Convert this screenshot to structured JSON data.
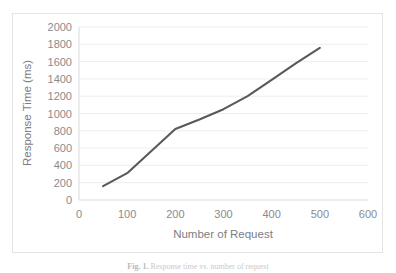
{
  "figure": {
    "caption_label": "Fig. 1.",
    "caption_text": "Response time vs. number of request"
  },
  "chart_data": {
    "type": "line",
    "title": "",
    "xlabel": "Number of Request",
    "ylabel": "Response Time (ms)",
    "xlim": [
      0,
      600
    ],
    "ylim": [
      0,
      2000
    ],
    "xticks": [
      0,
      100,
      200,
      300,
      400,
      500,
      600
    ],
    "xtick_labels": [
      "0",
      "100",
      "200",
      "300",
      "400",
      "500",
      "600"
    ],
    "yticks": [
      0,
      200,
      400,
      600,
      800,
      1000,
      1200,
      1400,
      1600,
      1800,
      2000
    ],
    "ytick_labels": [
      "0",
      "200",
      "400",
      "600",
      "800",
      "1000",
      "1200",
      "1400",
      "1600",
      "1800",
      "2000"
    ],
    "grid": "horizontal",
    "legend": "none",
    "series": [
      {
        "name": "Response Time",
        "color": "#595959",
        "x": [
          50,
          100,
          200,
          250,
          300,
          350,
          400,
          450,
          500
        ],
        "values": [
          160,
          310,
          820,
          930,
          1050,
          1200,
          1390,
          1580,
          1760
        ]
      }
    ]
  },
  "colors": {
    "line": "#595959",
    "grid": "#ededef",
    "axis": "#d9d9dc",
    "tick_text": "#8a8a8e",
    "axis_title_text": "#7d7d82",
    "frame_border": "#e4e4e6",
    "background": "#ffffff"
  }
}
